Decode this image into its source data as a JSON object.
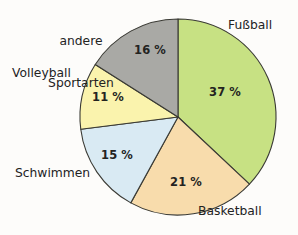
{
  "chart_data": {
    "type": "pie",
    "title": "",
    "subtitle": "",
    "xlabel": "",
    "ylabel": "",
    "legend_position": "none",
    "grid": false,
    "unit": "%",
    "categories": [
      "Fußball",
      "Basketball",
      "Schwimmen",
      "Volleyball",
      "andere Sportarten"
    ],
    "values": [
      37,
      21,
      15,
      11,
      16
    ],
    "start_angle_deg": 0,
    "direction": "clockwise",
    "slices": [
      {
        "label": "Fußball",
        "value": 37,
        "value_label": "37 %",
        "color": "#c7e183",
        "label_position": "right-top",
        "label_line1": "Fußball",
        "label_line2": ""
      },
      {
        "label": "Basketball",
        "value": 21,
        "value_label": "21 %",
        "color": "#f8dcac",
        "label_position": "bottom-right",
        "label_line1": "Basketball",
        "label_line2": ""
      },
      {
        "label": "Schwimmen",
        "value": 15,
        "value_label": "15 %",
        "color": "#d9eaf3",
        "label_position": "left-bottom",
        "label_line1": "Schwimmen",
        "label_line2": ""
      },
      {
        "label": "Volleyball",
        "value": 11,
        "value_label": "11 %",
        "color": "#faf3ad",
        "label_position": "left-top",
        "label_line1": "Volleyball",
        "label_line2": ""
      },
      {
        "label": "andere Sportarten",
        "value": 16,
        "value_label": "16 %",
        "color": "#a9a9a5",
        "label_position": "top-left",
        "label_line1": "andere",
        "label_line2": "Sportarten"
      }
    ],
    "colors": {
      "fussball": "#c7e183",
      "basketball": "#f8dcac",
      "schwimmen": "#d9eaf3",
      "volleyball": "#faf3ad",
      "andere_sportarten": "#a9a9a5",
      "outline": "#3a3a34",
      "text": "#23231f",
      "background": "#fdfcfa"
    }
  }
}
